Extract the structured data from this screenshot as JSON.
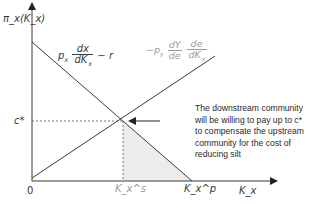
{
  "diagram": {
    "y_axis_label": "π_x(K_x)",
    "x_axis_label": "K_x",
    "origin_label": "0",
    "c_star_label": "c*",
    "k_s_label": "K_x^s",
    "k_p_label": "K_x^p",
    "upstream_curve": {
      "label_prefix": "p",
      "label_prefix_sub": "x",
      "frac_num": "dx",
      "frac_den": "dK",
      "frac_den_sub": "x",
      "label_suffix": "− r",
      "color": "#3a3a3a"
    },
    "downstream_curve": {
      "label_prefix": "−p",
      "label_prefix_sub": "y",
      "frac1_num": "dY",
      "frac1_den": "de",
      "frac2_num": "de",
      "frac2_den": "dK",
      "frac2_den_sub": "x",
      "color": "#9a9a9a"
    },
    "annotation": "The downstream community will be willing to pay up to c* to compensate the upstream community for the cost of reducing silt",
    "colors": {
      "axis": "#3a3a3a",
      "shade": "#ececec",
      "dashed": "#555555"
    }
  }
}
